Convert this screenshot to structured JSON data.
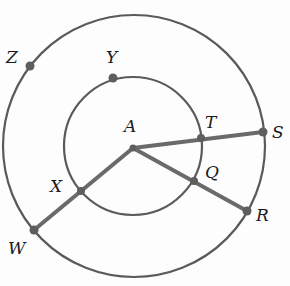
{
  "diagram": {
    "type": "concentric-circles",
    "colors": {
      "stroke": "#5a5a5a",
      "segment": "#6a6a6a",
      "point": "#5e5e5e",
      "label": "#1a1a1a"
    },
    "center": {
      "name": "A",
      "x": 133,
      "y": 147
    },
    "circles": [
      {
        "id": "outer",
        "cx": 134,
        "cy": 146,
        "r": 131
      },
      {
        "id": "inner",
        "cx": 133,
        "cy": 146,
        "r": 69
      }
    ],
    "points": {
      "A": {
        "x": 133,
        "y": 148
      },
      "T": {
        "x": 201,
        "y": 138
      },
      "S": {
        "x": 263,
        "y": 132
      },
      "Q": {
        "x": 194,
        "y": 181
      },
      "R": {
        "x": 247,
        "y": 211
      },
      "X": {
        "x": 81,
        "y": 191
      },
      "W": {
        "x": 34,
        "y": 230
      },
      "Y": {
        "x": 113,
        "y": 78
      },
      "Z": {
        "x": 30,
        "y": 66
      }
    },
    "segments": [
      {
        "from": "A",
        "to": "S",
        "through": "T"
      },
      {
        "from": "A",
        "to": "R",
        "through": "Q"
      },
      {
        "from": "A",
        "to": "W",
        "through": "X"
      }
    ],
    "labels": {
      "A": "A",
      "T": "T",
      "S": "S",
      "Q": "Q",
      "R": "R",
      "X": "X",
      "W": "W",
      "Y": "Y",
      "Z": "Z"
    }
  }
}
